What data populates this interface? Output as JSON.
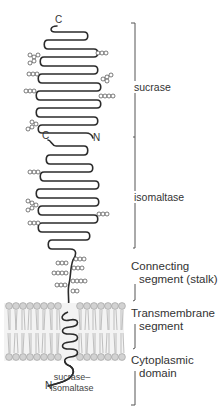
{
  "diagram": {
    "regions": [
      {
        "id": "sucrase",
        "label": "sucrase"
      },
      {
        "id": "isomaltase",
        "label": "isomaltase"
      },
      {
        "id": "stalk",
        "label_line1": "Connecting",
        "label_line2": "segment (stalk)"
      },
      {
        "id": "transmembrane",
        "label_line1": "Transmembrane",
        "label_line2": "segment"
      },
      {
        "id": "cytoplasmic",
        "label_line1": "Cytoplasmic",
        "label_line2": "domain"
      }
    ],
    "termini": {
      "sucrase_c": "C",
      "sucrase_n": "N",
      "isomaltase_c": "C",
      "protein_n": "N"
    },
    "protein_label_line1": "sucrase–",
    "protein_label_line2": "isomaltase",
    "colors": {
      "strand": "#2b2b2b",
      "lipid_head": "#c8c8c8",
      "lipid_tail": "#9a9a9a",
      "bracket": "#555555",
      "text": "#333333"
    }
  }
}
